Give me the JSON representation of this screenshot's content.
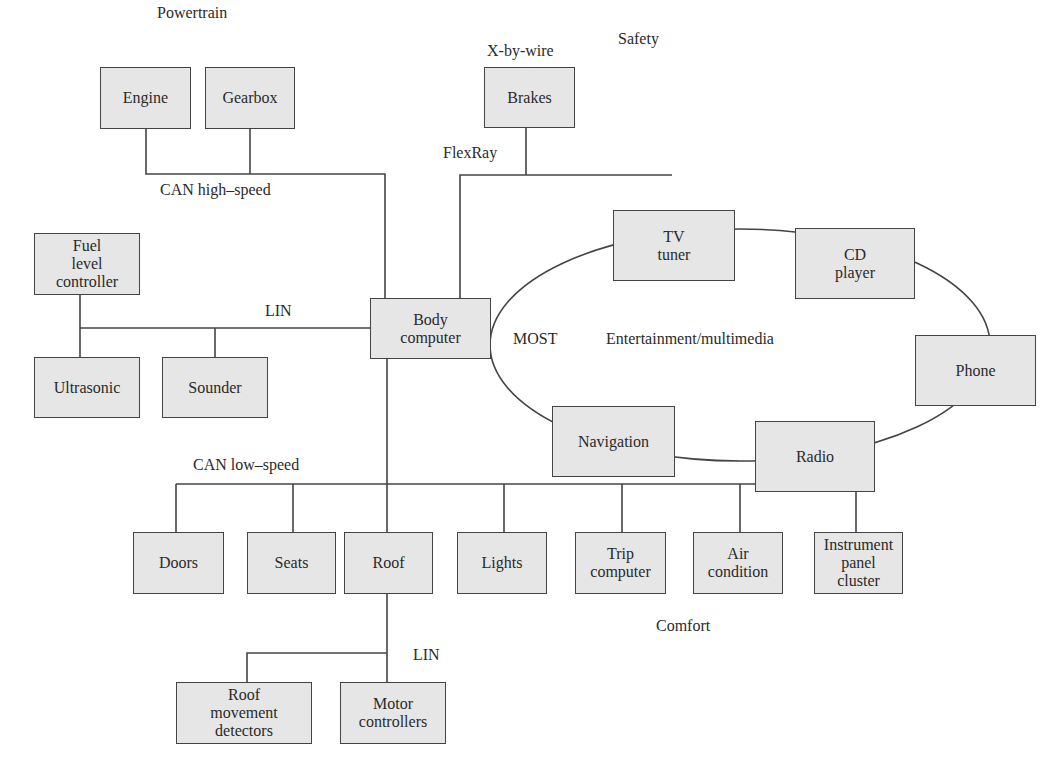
{
  "diagram": {
    "domains": {
      "powertrain": "Powertrain",
      "safety": "Safety",
      "xbywire": "X-by-wire",
      "entertainment": "Entertainment/multimedia",
      "comfort": "Comfort"
    },
    "buses": {
      "can_high": "CAN high–speed",
      "flexray": "FlexRay",
      "lin_left": "LIN",
      "most": "MOST",
      "can_low": "CAN low–speed",
      "lin_roof": "LIN"
    },
    "nodes": {
      "engine": "Engine",
      "gearbox": "Gearbox",
      "brakes": "Brakes",
      "fuel": "Fuel\nlevel\ncontroller",
      "ultrasonic": "Ultrasonic",
      "sounder": "Sounder",
      "body": "Body\ncomputer",
      "tv": "TV\ntuner",
      "cd": "CD\nplayer",
      "phone": "Phone",
      "radio": "Radio",
      "navigation": "Navigation",
      "doors": "Doors",
      "seats": "Seats",
      "roof": "Roof",
      "lights": "Lights",
      "trip": "Trip\ncomputer",
      "air": "Air\ncondition",
      "instrument": "Instrument\npanel\ncluster",
      "roof_movement": "Roof\nmovement\ndetectors",
      "motor": "Motor\ncontrollers"
    }
  }
}
